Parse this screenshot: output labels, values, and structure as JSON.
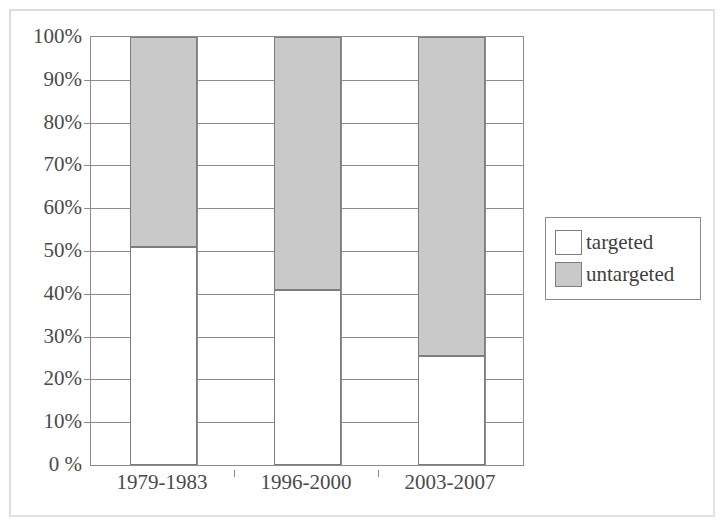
{
  "chart_data": {
    "type": "bar",
    "subtype": "stacked-100-percent",
    "title": "",
    "xlabel": "",
    "ylabel": "",
    "categories": [
      "1979-1983",
      "1996-2000",
      "2003-2007"
    ],
    "series": [
      {
        "name": "targeted",
        "values": [
          51,
          41,
          25.5
        ],
        "color": "#ffffff"
      },
      {
        "name": "untargeted",
        "values": [
          49,
          59,
          74.5
        ],
        "color": "#c9c9c9"
      }
    ],
    "ylim": [
      0,
      100
    ],
    "ytick_values": [
      0,
      10,
      20,
      30,
      40,
      50,
      60,
      70,
      80,
      90,
      100
    ],
    "ytick_labels": [
      "0 %",
      "10%",
      "20%",
      "30%",
      "40%",
      "50%",
      "60%",
      "70%",
      "80%",
      "90%",
      "100%"
    ],
    "grid": true,
    "grid_axis": "both",
    "legend": {
      "position": "right",
      "entries": [
        {
          "label": "targeted",
          "color": "#ffffff"
        },
        {
          "label": "untargeted",
          "color": "#c9c9c9"
        }
      ]
    },
    "axis_color": "#8c8c8c",
    "text_color": "#4a4a4a",
    "bar_edge_color": "#7d7d7d",
    "background": "#ffffff"
  }
}
